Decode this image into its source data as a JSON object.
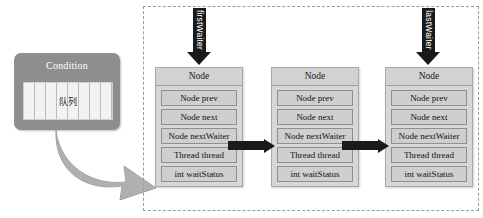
{
  "diagram": {
    "condition": {
      "title": "Condition",
      "queue_label": "队列",
      "cell_count": 8,
      "fill_color": "#8e8e8e",
      "text_color": "#ffffff"
    },
    "flow_arrow": {
      "name": "curved-arrow",
      "color": "#b0b0b0",
      "direction": "right-down"
    },
    "pointers": [
      {
        "label": "firstWaiter",
        "target_index": 0
      },
      {
        "label": "lastWaiter",
        "target_index": 2
      }
    ],
    "node_fields": [
      "Node prev",
      "Node next",
      "Node nextWaiter",
      "Thread thread",
      "int waitStatus"
    ],
    "nodes": [
      {
        "title": "Node",
        "fields": [
          "Node prev",
          "Node next",
          "Node nextWaiter",
          "Thread thread",
          "int waitStatus"
        ]
      },
      {
        "title": "Node",
        "fields": [
          "Node prev",
          "Node next",
          "Node nextWaiter",
          "Thread thread",
          "int waitStatus"
        ]
      },
      {
        "title": "Node",
        "fields": [
          "Node prev",
          "Node next",
          "Node nextWaiter",
          "Thread thread",
          "int waitStatus"
        ]
      }
    ],
    "links": [
      {
        "from_index": 0,
        "to_index": 1,
        "from_field": "Node nextWaiter",
        "label": ""
      },
      {
        "from_index": 1,
        "to_index": 2,
        "from_field": "Node nextWaiter",
        "label": ""
      }
    ],
    "colors": {
      "node_fill": "#d7d7d7",
      "node_border": "#a8a8a8",
      "field_fill": "#cfcfcf",
      "field_border": "#8f8f8f",
      "arrow_black": "#1a1a1a",
      "dashed_border": "#9a9a9a",
      "background": "#ffffff"
    }
  }
}
